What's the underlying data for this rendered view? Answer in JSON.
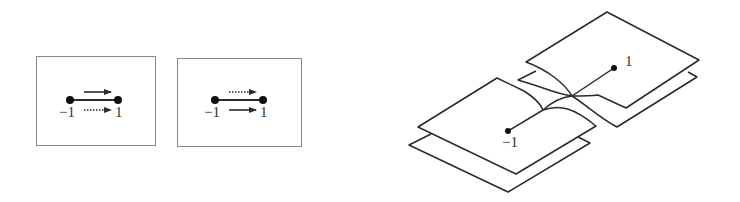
{
  "panels": [
    {
      "name": "panel-left",
      "start_label": "−1",
      "end_label": "1",
      "top_arrow": "solid",
      "bottom_arrow": "dotted"
    },
    {
      "name": "panel-middle",
      "start_label": "−1",
      "end_label": "1",
      "top_arrow": "dotted",
      "bottom_arrow": "solid"
    }
  ],
  "riemann_surface": {
    "point_neg_label": "−1",
    "point_pos_label": "1",
    "sheets": 4,
    "description": "Two-sheeted cover with branch cut between -1 and 1"
  },
  "colors": {
    "line": "#2a2a2a",
    "frame": "#8a8a8a"
  }
}
